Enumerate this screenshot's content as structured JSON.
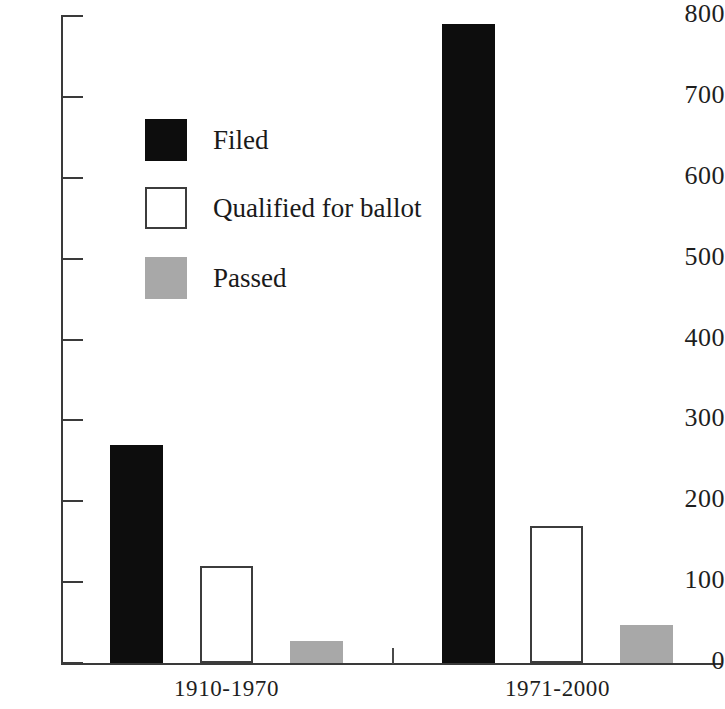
{
  "chart_data": {
    "type": "bar",
    "title": "",
    "subtitle": "",
    "xlabel": "",
    "ylabel": "",
    "categories": [
      "1910-1970",
      "1971-2000"
    ],
    "series": [
      {
        "name": "Filed",
        "values": [
          270,
          790
        ],
        "color": "#0d0d0d"
      },
      {
        "name": "Qualified for ballot",
        "values": [
          120,
          170
        ],
        "color": "#ffffff"
      },
      {
        "name": "Passed",
        "values": [
          27,
          47
        ],
        "color": "#a8a8a8"
      }
    ],
    "ylim": [
      0,
      800
    ],
    "ytick_labels": [
      "800",
      "700",
      "600",
      "500",
      "400",
      "300",
      "200",
      "100",
      "0"
    ],
    "ytick_values": [
      800,
      700,
      600,
      500,
      400,
      300,
      200,
      100,
      0
    ],
    "grid": false,
    "legend_position": "upper-left",
    "annotations": []
  },
  "legend": {
    "items": [
      {
        "label": "Filed",
        "swatch": "filed"
      },
      {
        "label": "Qualified for ballot",
        "swatch": "qualified"
      },
      {
        "label": "Passed",
        "swatch": "passed"
      }
    ]
  },
  "colors": {
    "filed": "#0d0d0d",
    "qualified": "#ffffff",
    "passed": "#a8a8a8",
    "axis": "#3a3a3a",
    "background": "#ffffff"
  }
}
